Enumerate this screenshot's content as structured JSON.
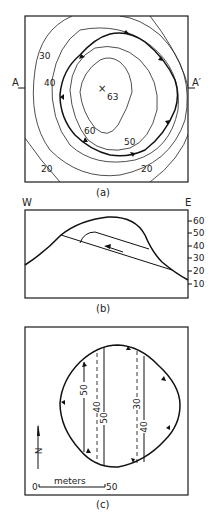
{
  "panel_a": {
    "caption": "(a)",
    "section_left": "A",
    "section_right": "A′",
    "peak_marker": "×",
    "peak_value": "63",
    "contour_labels": [
      "30",
      "40",
      "60",
      "50",
      "20",
      "20"
    ]
  },
  "panel_b": {
    "caption": "(b)",
    "west": "W",
    "east": "E",
    "axis_ticks": [
      "60",
      "50",
      "40",
      "30",
      "20",
      "10"
    ]
  },
  "panel_c": {
    "caption": "(c)",
    "line_labels": [
      "50",
      "40",
      "50",
      "30",
      "40"
    ],
    "north_label": "N",
    "scale_label": "meters",
    "scale_start": "0",
    "scale_end": "50"
  }
}
